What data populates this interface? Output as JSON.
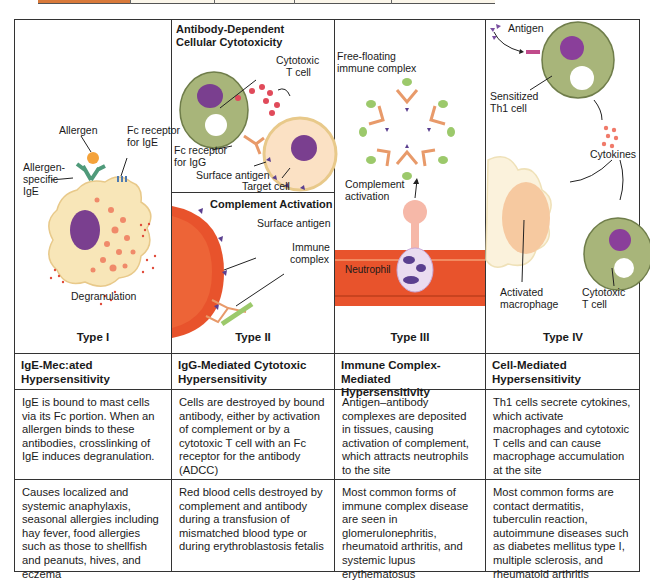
{
  "diagram": {
    "columns": [
      {
        "type_label": "Type I",
        "header": "IgE-Mec:ated Hypersensitivity",
        "header_lines": [
          "IgE-Mec:ated",
          "Hypersensitivity"
        ],
        "mechanism": "IgE is bound to mast cells via its Fc portion. When an allergen binds to these antibodies, crosslinking of IgE induces degranulation.",
        "examples": "Causes localized and systemic anaphylaxis, seasonal allergies including hay fever, food allergies such as those to shellfish and peanuts, hives, and eczema",
        "illustration_labels": {
          "allergen": "Allergen",
          "fc_receptor": "Fc receptor",
          "fc_receptor_2": "for IgE",
          "allergen_specific_1": "Allergen-",
          "allergen_specific_2": "specific",
          "allergen_specific_3": "IgE",
          "degranulation": "Degranulation"
        }
      },
      {
        "type_label": "Type II",
        "header_lines": [
          "IgG-Mediated Cytotoxic",
          "Hypersensitivity"
        ],
        "mechanism": "Cells are destroyed by bound antibody, either by activation of complement or by a cytotoxic T cell with an Fc receptor for the antibody (ADCC)",
        "examples": "Red blood cells destroyed by complement and antibody during a transfusion of mismatched blood type or during erythroblastosis fetalis",
        "illustration_labels": {
          "adcc_title_1": "Antibody-Dependent",
          "adcc_title_2": "Cellular Cytotoxicity",
          "cytotoxic_1": "Cytotoxic",
          "cytotoxic_2": "T cell",
          "fc_receptor_1": "Fc receptor",
          "fc_receptor_2": "for IgG",
          "surface_antigen": "Surface antigen",
          "target_cell": "Target cell",
          "complement_title": "Complement Activation",
          "surface_antigen_2": "Surface antigen",
          "immune_1": "Immune",
          "immune_2": "complex"
        }
      },
      {
        "type_label": "Type III",
        "header_lines": [
          "Immune Complex-Mediated",
          "Hypersensitivity"
        ],
        "mechanism": "Antigen–antibody complexes are deposited in tissues, causing activation of complement, which attracts neutrophils to the site",
        "examples": "Most common forms of immune complex disease are seen in glomerulonephritis, rheumatoid arthritis, and systemic lupus erythematosus",
        "illustration_labels": {
          "free_floating_1": "Free-floating",
          "free_floating_2": "immune complex",
          "complement_1": "Complement",
          "complement_2": "activation",
          "neutrophil": "Neutrophil"
        }
      },
      {
        "type_label": "Type IV",
        "header_lines": [
          "Cell-Mediated",
          "Hypersensitivity"
        ],
        "mechanism": "Th1 cells secrete cytokines, which activate macrophages and cytotoxic T cells and can cause macrophage accumulation at the site",
        "examples": "Most common forms are contact dermatitis, tuberculin reaction, autoimmune diseases such as diabetes mellitus type I, multiple sclerosis, and rheumatoid arthritis",
        "illustration_labels": {
          "antigen": "Antigen",
          "sensitized_1": "Sensitized",
          "sensitized_2": "Th1 cell",
          "cytokines": "Cytokines",
          "activated_1": "Activated",
          "activated_2": "macrophage",
          "cytotoxic_1": "Cytotoxic",
          "cytotoxic_2": "T cell"
        }
      }
    ],
    "colors": {
      "border": "#333333",
      "rbc": "#e8532c",
      "tcell": "#a8b57a",
      "nucleus": "#7a3f8f",
      "antibody": "#e89a6a",
      "complement": "#9cc96b",
      "mast_cell": "#f8e6b8",
      "strip_orange": "#d97a3a"
    }
  }
}
